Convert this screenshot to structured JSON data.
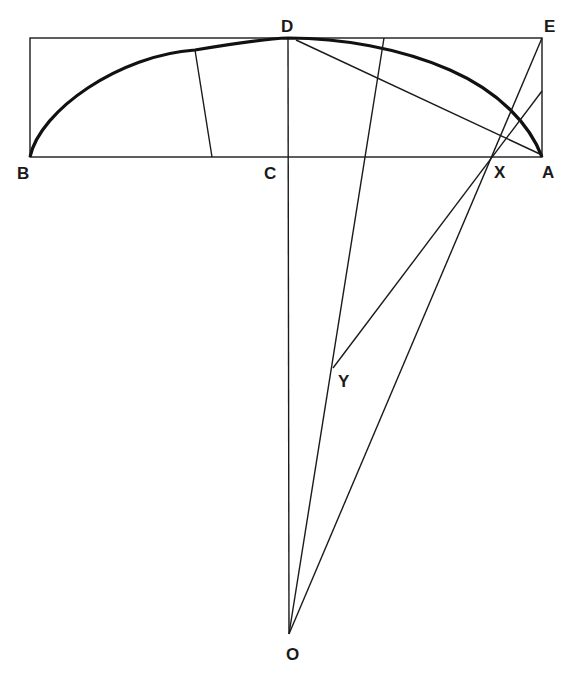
{
  "diagram": {
    "type": "geometric-construction",
    "points": {
      "B": {
        "label": "B",
        "x": 30,
        "y": 157
      },
      "C": {
        "label": "C",
        "x": 288,
        "y": 157
      },
      "A": {
        "label": "A",
        "x": 542,
        "y": 157
      },
      "D": {
        "label": "D",
        "x": 288,
        "y": 38
      },
      "E": {
        "label": "E",
        "x": 542,
        "y": 38
      },
      "X": {
        "label": "X",
        "x": 492,
        "y": 157
      },
      "Y": {
        "label": "Y",
        "x": 333,
        "y": 368
      },
      "O": {
        "label": "O",
        "x": 289,
        "y": 634
      }
    },
    "labels": {
      "B": "B",
      "C": "C",
      "D": "D",
      "E": "E",
      "X": "X",
      "A": "A",
      "Y": "Y",
      "O": "O"
    }
  }
}
